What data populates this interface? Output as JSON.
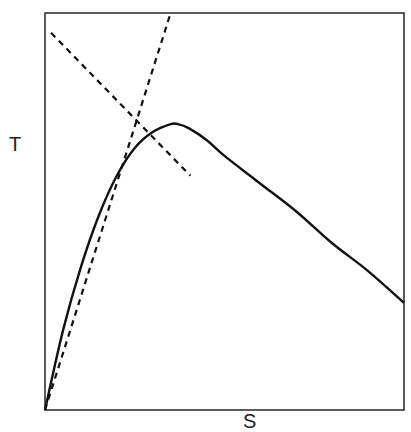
{
  "chart_data": {
    "type": "line",
    "title": "",
    "xlabel": "S",
    "ylabel": "T",
    "grid": false,
    "legend": null,
    "axis_ticks": "none",
    "xlim": [
      0,
      1
    ],
    "ylim": [
      0,
      1
    ],
    "series": [
      {
        "name": "curve",
        "style": "solid",
        "x": [
          0.0,
          0.05,
          0.1,
          0.15,
          0.2,
          0.25,
          0.3,
          0.35,
          0.37,
          0.4,
          0.45,
          0.5,
          0.6,
          0.7,
          0.8,
          0.9,
          1.0
        ],
        "y": [
          0.0,
          0.2,
          0.36,
          0.49,
          0.59,
          0.66,
          0.7,
          0.72,
          0.72,
          0.71,
          0.68,
          0.64,
          0.57,
          0.5,
          0.42,
          0.35,
          0.27
        ]
      },
      {
        "name": "asymptote-rising",
        "style": "dashed",
        "x": [
          0.0,
          0.35
        ],
        "y": [
          0.0,
          1.0
        ]
      },
      {
        "name": "asymptote-falling",
        "style": "dashed",
        "x": [
          0.017,
          0.405
        ],
        "y": [
          0.95,
          0.59
        ]
      }
    ]
  },
  "labels": {
    "x": "S",
    "y": "T"
  }
}
